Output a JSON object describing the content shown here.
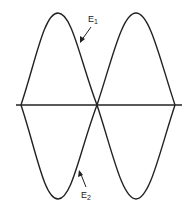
{
  "diagram": {
    "type": "waveform",
    "labels": {
      "e1": "E",
      "e1_sub": "1",
      "e2": "E",
      "e2_sub": "2"
    },
    "colors": {
      "stroke": "#222222",
      "background": "#ffffff"
    }
  }
}
